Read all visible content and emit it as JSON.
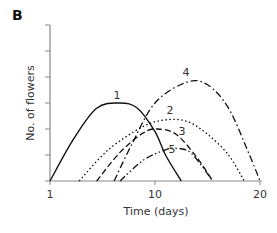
{
  "panel": {
    "letter": "B"
  },
  "chart_data": {
    "type": "line",
    "title": "",
    "xlabel": "Time (days)",
    "ylabel": "No. of flowers",
    "xlim": [
      1,
      20
    ],
    "ylim": [
      0,
      6
    ],
    "x_ticks": [
      "1",
      "10",
      "20"
    ],
    "y_ticks_labeled": false,
    "y_tick_count": 7,
    "grid": false,
    "legend": "inline curve labels",
    "series": [
      {
        "name": "1",
        "style": "solid",
        "x": [
          1,
          3,
          5,
          7,
          8.5,
          10,
          11,
          12.5
        ],
        "y": [
          0,
          1.6,
          2.8,
          3.0,
          2.8,
          1.9,
          1.0,
          0
        ]
      },
      {
        "name": "2",
        "style": "dotted",
        "x": [
          3.5,
          6,
          9,
          11,
          13,
          15,
          17,
          18.5
        ],
        "y": [
          0,
          1.2,
          2.1,
          2.35,
          2.3,
          1.8,
          1.0,
          0
        ]
      },
      {
        "name": "3",
        "style": "dashed",
        "x": [
          5,
          7,
          9,
          10.2,
          12,
          14,
          15.5
        ],
        "y": [
          0,
          1.1,
          1.85,
          2.0,
          1.8,
          0.9,
          0
        ]
      },
      {
        "name": "4",
        "style": "dash-dot",
        "x": [
          6.5,
          8,
          10,
          13,
          15,
          17,
          19,
          20
        ],
        "y": [
          0,
          1.4,
          3.0,
          3.8,
          3.7,
          2.8,
          1.0,
          0
        ]
      },
      {
        "name": "5",
        "style": "dash-dot-dot",
        "x": [
          7,
          9,
          11,
          12.2,
          13.5,
          15.5
        ],
        "y": [
          0,
          0.8,
          1.2,
          1.25,
          1.05,
          0
        ]
      }
    ]
  }
}
